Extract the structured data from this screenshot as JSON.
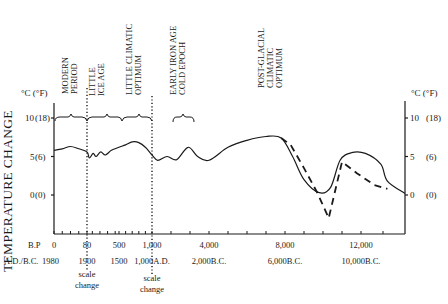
{
  "chart_data": {
    "type": "line",
    "title": "",
    "ylabel": "TEMPERATURE CHANGE",
    "yunit_label": "°C (°F)",
    "ylim": [
      -4.5,
      14
    ],
    "yticks": [
      {
        "c": 10,
        "label_c": "10",
        "label_f": "(18)"
      },
      {
        "c": 5,
        "label_c": "5",
        "label_f": "(6)"
      },
      {
        "c": 0,
        "label_c": "0",
        "label_f": "(0)"
      }
    ],
    "xaxis_bp_label": "B.P",
    "xaxis_ad_label": "A.D./B.C.",
    "xticks": [
      {
        "bp": "0",
        "ad": "1980"
      },
      {
        "bp": "80",
        "ad": "1900"
      },
      {
        "bp": "500",
        "ad": "1500"
      },
      {
        "bp": "1,000",
        "ad": "1,000A.D."
      },
      {
        "bp": "4,000",
        "ad": "2,000B.C."
      },
      {
        "bp": "8,000",
        "ad": "6,000B.C."
      },
      {
        "bp": "12,000",
        "ad": "10,000B.C."
      }
    ],
    "scale_changes": [
      {
        "at_bp": "80",
        "label": "scale change"
      },
      {
        "at_bp": "1,000",
        "label": "scale change"
      }
    ],
    "periods": [
      {
        "name": "MODERN PERIOD",
        "lines": [
          "MODERN",
          "PERIOD"
        ]
      },
      {
        "name": "LITTLE ICE AGE",
        "lines": [
          "LITTLE",
          "ICE AGE"
        ]
      },
      {
        "name": "LITTLE CLIMATIC OPTIMUM",
        "lines": [
          "LITTLE CLIMATIC",
          "OPTIMUM"
        ]
      },
      {
        "name": "EARLY IRON AGE COLD EPOCH",
        "lines": [
          "EARLY IRON AGE",
          "COLD EPOCH"
        ]
      },
      {
        "name": "POST-GLACIAL CLIMATIC OPTIMUM",
        "lines": [
          "POST-GLACIAL",
          "CLIMATIC",
          "OPTIMUM"
        ]
      }
    ],
    "series": [
      {
        "name": "Temperature (solid)",
        "style": "solid",
        "points_bp": [
          [
            0,
            5.8
          ],
          [
            20,
            6.0
          ],
          [
            40,
            6.3
          ],
          [
            60,
            6.0
          ],
          [
            80,
            5.6
          ],
          [
            110,
            4.8
          ],
          [
            160,
            5.4
          ],
          [
            200,
            5.0
          ],
          [
            260,
            5.6
          ],
          [
            320,
            5.2
          ],
          [
            400,
            5.8
          ],
          [
            500,
            6.2
          ],
          [
            600,
            6.5
          ],
          [
            700,
            6.9
          ],
          [
            800,
            6.8
          ],
          [
            900,
            6.2
          ],
          [
            1000,
            5.2
          ],
          [
            1300,
            4.5
          ],
          [
            1800,
            5.0
          ],
          [
            2300,
            4.6
          ],
          [
            2900,
            6.2
          ],
          [
            3400,
            5.0
          ],
          [
            4000,
            4.5
          ],
          [
            5000,
            6.2
          ],
          [
            6000,
            7.1
          ],
          [
            7000,
            7.6
          ],
          [
            7800,
            7.4
          ],
          [
            8400,
            5.0
          ],
          [
            9000,
            2.0
          ],
          [
            9800,
            0.3
          ],
          [
            10400,
            1.0
          ],
          [
            10900,
            4.5
          ],
          [
            11500,
            5.5
          ],
          [
            12200,
            5.4
          ],
          [
            12900,
            4.0
          ],
          [
            13200,
            1.8
          ],
          [
            14000,
            0.2
          ]
        ]
      },
      {
        "name": "Temperature (dashed)",
        "style": "dashed",
        "points_bp": [
          [
            7800,
            7.4
          ],
          [
            8300,
            6.5
          ],
          [
            9000,
            3.5
          ],
          [
            9700,
            0.3
          ],
          [
            10300,
            -3.0
          ],
          [
            11000,
            4.3
          ],
          [
            11800,
            2.8
          ],
          [
            12600,
            1.3
          ],
          [
            13200,
            0.8
          ]
        ]
      }
    ],
    "grid": false,
    "legend": null
  }
}
